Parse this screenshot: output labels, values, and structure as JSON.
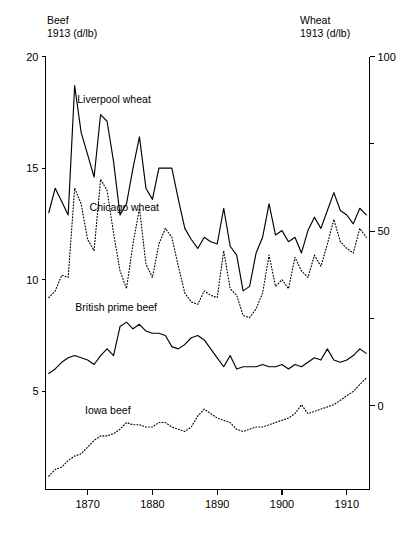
{
  "chart_data": {
    "type": "line",
    "title": "",
    "xlabel": "",
    "grid": false,
    "legend_position": "inline-annotations",
    "x": [
      1864,
      1865,
      1866,
      1867,
      1868,
      1869,
      1870,
      1871,
      1872,
      1873,
      1874,
      1875,
      1876,
      1877,
      1878,
      1879,
      1880,
      1881,
      1882,
      1883,
      1884,
      1885,
      1886,
      1887,
      1888,
      1889,
      1890,
      1891,
      1892,
      1893,
      1894,
      1895,
      1896,
      1897,
      1898,
      1899,
      1900,
      1901,
      1902,
      1903,
      1904,
      1905,
      1906,
      1907,
      1908,
      1909,
      1910,
      1911,
      1912,
      1913
    ],
    "xlim": [
      1863.5,
      1913.5
    ],
    "xticks": [
      1870,
      1880,
      1890,
      1900,
      1910
    ],
    "xticklabels": [
      "1870",
      "1880",
      "1890",
      "1900",
      "1910"
    ],
    "left_axis": {
      "label_line1": "Beef",
      "label_line2": "1913 (d/lb)",
      "ylabel": "Beef 1913 (d/lb)",
      "ylim": [
        0.6,
        20
      ],
      "ticks": [
        20,
        15,
        10,
        5
      ],
      "ticklabels": [
        "20",
        "15",
        "10",
        "5"
      ]
    },
    "right_axis": {
      "label_line1": "Wheat",
      "label_line2": "1913 (d/lb)",
      "ylabel": "Wheat 1913 (d/lb)",
      "ylim": [
        -24,
        100
      ],
      "ticks": [
        100,
        75,
        50,
        25,
        0
      ],
      "ticklabels": [
        "100",
        "",
        "50",
        "",
        "0"
      ],
      "major_ticks": [
        100,
        50,
        0
      ]
    },
    "series": [
      {
        "name": "Liverpool wheat",
        "axis": "left",
        "style": "solid",
        "color": "#000000",
        "label_x": 1868.4,
        "label_y": 17.9,
        "values": [
          13.0,
          14.1,
          13.5,
          12.9,
          18.7,
          16.6,
          15.6,
          14.6,
          17.4,
          17.1,
          15.3,
          12.9,
          13.4,
          15.0,
          16.4,
          14.1,
          13.6,
          15.0,
          15.0,
          15.0,
          13.6,
          12.3,
          11.8,
          11.4,
          11.9,
          11.7,
          11.6,
          13.2,
          11.5,
          11.1,
          9.5,
          9.7,
          11.2,
          11.9,
          13.4,
          12.0,
          12.2,
          11.7,
          11.9,
          11.2,
          12.2,
          12.8,
          12.3,
          13.1,
          13.9,
          13.1,
          12.9,
          12.5,
          13.2,
          12.9
        ]
      },
      {
        "name": "Chicago wheat",
        "axis": "left",
        "style": "dotted",
        "color": "#000000",
        "label_x": 1870.3,
        "label_y": 13.1,
        "values": [
          9.2,
          9.5,
          10.2,
          10.1,
          14.1,
          13.4,
          11.8,
          11.3,
          14.5,
          14.0,
          12.1,
          10.4,
          9.6,
          11.6,
          13.2,
          10.7,
          10.1,
          11.6,
          12.3,
          11.9,
          10.6,
          9.4,
          9.0,
          8.9,
          9.5,
          9.3,
          9.2,
          11.3,
          9.6,
          9.3,
          8.4,
          8.3,
          8.7,
          9.4,
          11.1,
          9.7,
          10.0,
          9.6,
          11.0,
          10.4,
          10.1,
          11.1,
          10.6,
          11.6,
          12.7,
          11.7,
          11.4,
          11.2,
          12.3,
          11.9
        ]
      },
      {
        "name": "British prime beef",
        "axis": "left",
        "style": "solid",
        "color": "#000000",
        "label_x": 1868.1,
        "label_y": 8.6,
        "values": [
          5.8,
          6.0,
          6.3,
          6.5,
          6.6,
          6.5,
          6.4,
          6.2,
          6.6,
          6.9,
          6.6,
          7.9,
          8.1,
          7.8,
          8.0,
          7.7,
          7.6,
          7.6,
          7.5,
          7.0,
          6.9,
          7.1,
          7.4,
          7.5,
          7.3,
          6.9,
          6.5,
          6.1,
          6.6,
          6.0,
          6.1,
          6.1,
          6.1,
          6.2,
          6.1,
          6.1,
          6.2,
          6.0,
          6.2,
          6.1,
          6.3,
          6.5,
          6.4,
          6.9,
          6.4,
          6.3,
          6.4,
          6.6,
          6.9,
          6.7
        ]
      },
      {
        "name": "Iowa beef",
        "axis": "left",
        "style": "dotted",
        "color": "#000000",
        "label_x": 1869.6,
        "label_y": 4.0,
        "values": [
          1.2,
          1.5,
          1.6,
          1.9,
          2.1,
          2.2,
          2.5,
          2.8,
          3.0,
          3.0,
          3.1,
          3.3,
          3.6,
          3.5,
          3.5,
          3.4,
          3.4,
          3.6,
          3.6,
          3.4,
          3.3,
          3.2,
          3.4,
          3.9,
          4.2,
          4.0,
          3.8,
          3.7,
          3.6,
          3.3,
          3.2,
          3.3,
          3.4,
          3.4,
          3.5,
          3.6,
          3.7,
          3.8,
          4.0,
          4.4,
          4.0,
          4.1,
          4.2,
          4.3,
          4.4,
          4.6,
          4.8,
          5.0,
          5.3,
          5.6
        ]
      }
    ]
  }
}
